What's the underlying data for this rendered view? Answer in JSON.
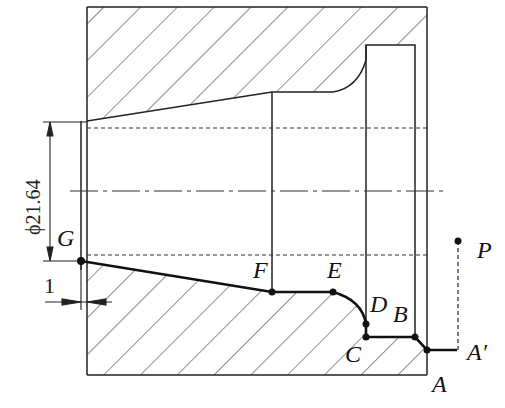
{
  "figure": {
    "type": "lathe-turning-toolpath-section",
    "colors": {
      "line": "#222222",
      "toolpath": "#111111",
      "background": "#ffffff"
    }
  },
  "dimensions": {
    "diameter": "ϕ21.64",
    "offset": "1"
  },
  "points": [
    {
      "id": "G",
      "label": "G",
      "x": 81,
      "y": 261
    },
    {
      "id": "F",
      "label": "F",
      "x": 272,
      "y": 292
    },
    {
      "id": "E",
      "label": "E",
      "x": 333,
      "y": 292
    },
    {
      "id": "D",
      "label": "D",
      "x": 366,
      "y": 324
    },
    {
      "id": "C",
      "label": "C",
      "x": 366,
      "y": 337
    },
    {
      "id": "B",
      "label": "B",
      "x": 415,
      "y": 337
    },
    {
      "id": "A",
      "label": "A",
      "x": 427,
      "y": 350
    },
    {
      "id": "A_prime",
      "label": "A′",
      "x": 457,
      "y": 350
    },
    {
      "id": "P",
      "label": "P",
      "x": 458,
      "y": 241
    }
  ]
}
